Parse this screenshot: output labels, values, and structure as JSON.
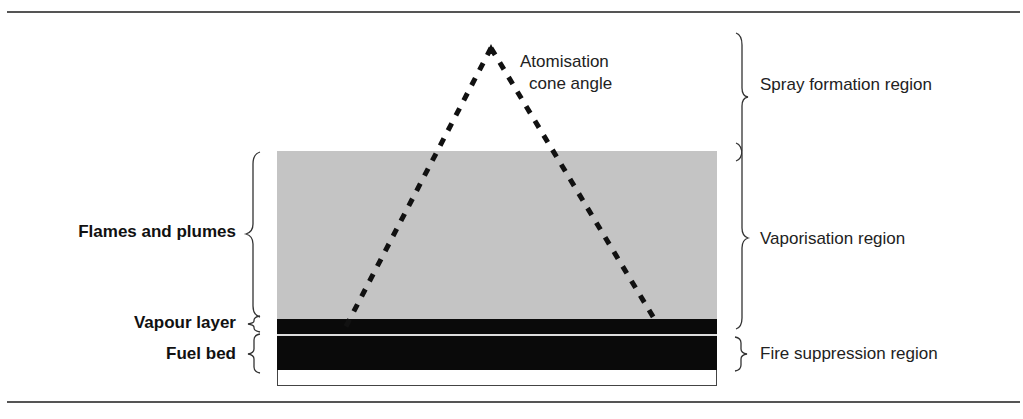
{
  "diagram": {
    "left_labels": {
      "flames_and_plumes": "Flames and plumes",
      "vapour_layer": "Vapour layer",
      "fuel_bed": "Fuel bed"
    },
    "right_labels": {
      "spray_formation": "Spray formation region",
      "vaporisation": "Vaporisation region",
      "fire_suppression": "Fire suppression region"
    },
    "cone_label": {
      "line1": "Atomisation",
      "line2": "cone angle"
    },
    "colors": {
      "flame_region": "#c4c4c4",
      "vapour_layer": "#0a0a0a",
      "fuel_bed": "#0a0a0a",
      "rules": "#555555",
      "spray_cone": "#111111"
    }
  }
}
